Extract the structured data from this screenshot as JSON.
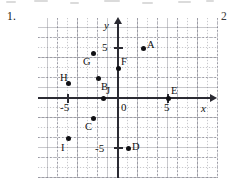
{
  "item_number": "1.",
  "next_item_number": "2",
  "graph": {
    "axis_labels": {
      "x": "x",
      "y": "y"
    },
    "tick_labels": [
      {
        "text": "-5",
        "axis": "x",
        "value": -5
      },
      {
        "text": "5",
        "axis": "x",
        "value": 5
      },
      {
        "text": "5",
        "axis": "y",
        "value": 5
      },
      {
        "text": "-5",
        "axis": "y",
        "value": -5
      },
      {
        "text": "0",
        "axis": "origin",
        "value": 0
      }
    ],
    "grid": "dotted",
    "grid_spacing_units": 1,
    "x_range": [
      -8,
      9
    ],
    "y_range": [
      -8,
      7
    ],
    "points": [
      {
        "label": "A",
        "x": 2.5,
        "y": 5,
        "label_pos": "right"
      },
      {
        "label": "B",
        "x": -2,
        "y": 2,
        "label_pos": "below-right"
      },
      {
        "label": "C",
        "x": -2.5,
        "y": -2,
        "label_pos": "below-left"
      },
      {
        "label": "D",
        "x": 1,
        "y": -5,
        "label_pos": "right"
      },
      {
        "label": "E",
        "x": 5,
        "y": 0,
        "label_pos": "above-right"
      },
      {
        "label": "F",
        "x": 0,
        "y": 3,
        "label_pos": "above-right"
      },
      {
        "label": "G",
        "x": -2.5,
        "y": 4.5,
        "label_pos": "below-left"
      },
      {
        "label": "H",
        "x": -5,
        "y": 1.5,
        "label_pos": "above-left"
      },
      {
        "label": "I",
        "x": -5,
        "y": -4,
        "label_pos": "below-left"
      },
      {
        "label": "J",
        "x": -1.5,
        "y": 0,
        "label_pos": "above-right"
      }
    ]
  },
  "colors": {
    "ink": "#101014",
    "axis": "#2b2b33",
    "grid": "#787882",
    "page": "#ffffff"
  }
}
